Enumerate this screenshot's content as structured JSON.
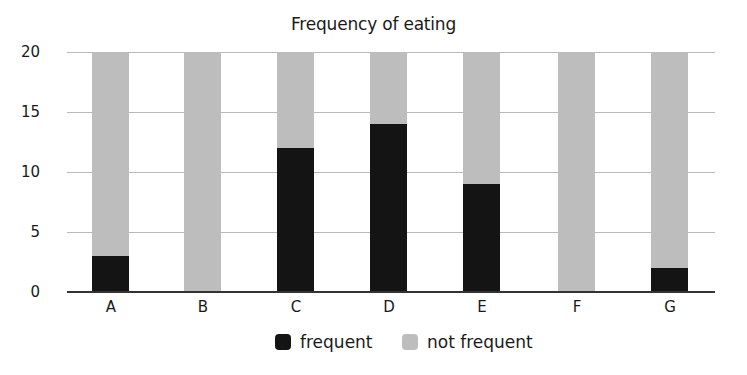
{
  "chart_data": {
    "type": "bar",
    "stacked": true,
    "title": "Frequency of eating",
    "xlabel": "",
    "ylabel": "",
    "categories": [
      "A",
      "B",
      "C",
      "D",
      "E",
      "F",
      "G"
    ],
    "series": [
      {
        "name": "frequent",
        "color": "#141414",
        "values": [
          3,
          0,
          12,
          14,
          9,
          0,
          2
        ]
      },
      {
        "name": "not frequent",
        "color": "#bdbdbd",
        "values": [
          17,
          20,
          8,
          6,
          11,
          20,
          18
        ]
      }
    ],
    "ylim": [
      0,
      20
    ],
    "yticks": [
      0,
      5,
      10,
      15,
      20
    ],
    "grid": true,
    "legend_position": "bottom"
  },
  "labels": {
    "title": "Frequency of eating",
    "yticks": [
      "20",
      "15",
      "10",
      "5",
      "0"
    ],
    "xticks": [
      "A",
      "B",
      "C",
      "D",
      "E",
      "F",
      "G"
    ],
    "legend": [
      "frequent",
      "not frequent"
    ]
  }
}
